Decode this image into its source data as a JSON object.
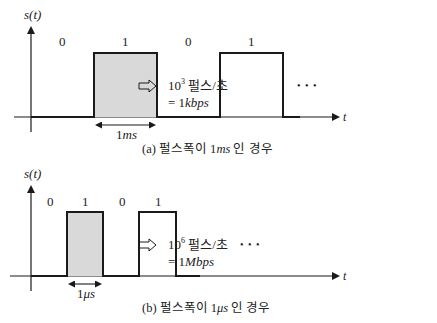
{
  "panel_a": {
    "ylabel": "s(t)",
    "xlabel": "t",
    "bits": [
      "0",
      "1",
      "0",
      "1"
    ],
    "width_label_num": "1",
    "width_label_unit": "ms",
    "ellipsis": "• • •",
    "rate_base": "10",
    "rate_exp": "3",
    "rate_unit": " 펄스/초",
    "rate_eq": "= 1",
    "rate_bps": "kbps",
    "caption_pre": "(a) 펄스폭이 1",
    "caption_unit": "ms",
    "caption_post": " 인 경우"
  },
  "panel_b": {
    "ylabel": "s(t)",
    "xlabel": "t",
    "bits": [
      "0",
      "1",
      "0",
      "1"
    ],
    "width_label_num": "1",
    "width_label_unit": "μs",
    "ellipsis": "• • •",
    "rate_base": "10",
    "rate_exp": "6",
    "rate_unit": " 펄스/초",
    "rate_eq": "= 1",
    "rate_bps": "Mbps",
    "caption_pre": "(b) 펄스폭이 1",
    "caption_unit": "μs",
    "caption_post": " 인 경우"
  },
  "colors": {
    "line": "#1a1a1a",
    "fill": "#d9d9d9"
  }
}
